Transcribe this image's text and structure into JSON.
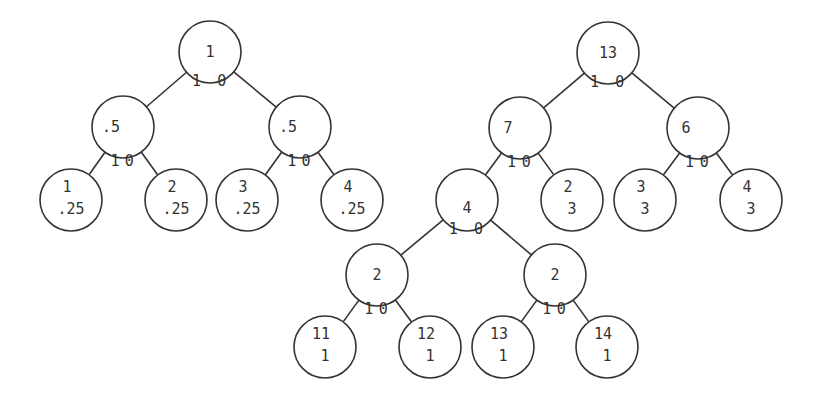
{
  "diagram": {
    "title": "",
    "colors": {
      "stroke": "#333333",
      "text": "#333333",
      "background": "#ffffff"
    },
    "node_radius": 31,
    "trees": [
      {
        "id": "left-tree",
        "nodes": [
          {
            "id": "L0",
            "x": 210,
            "y": 52,
            "lines": [
              "1"
            ]
          },
          {
            "id": "L1",
            "x": 123,
            "y": 127,
            "lines": [
              ".5"
            ],
            "align": "left"
          },
          {
            "id": "L2",
            "x": 300,
            "y": 127,
            "lines": [
              ".5"
            ],
            "align": "left"
          },
          {
            "id": "L3",
            "x": 71,
            "y": 200,
            "lines": [
              "1",
              ".25"
            ]
          },
          {
            "id": "L4",
            "x": 176,
            "y": 200,
            "lines": [
              "2",
              ".25"
            ]
          },
          {
            "id": "L5",
            "x": 247,
            "y": 200,
            "lines": [
              "3",
              ".25"
            ]
          },
          {
            "id": "L6",
            "x": 352,
            "y": 200,
            "lines": [
              "4",
              ".25"
            ]
          }
        ],
        "edges": [
          {
            "from": "L0",
            "to": "L1",
            "label": "1"
          },
          {
            "from": "L0",
            "to": "L2",
            "label": "0"
          },
          {
            "from": "L1",
            "to": "L3",
            "label": "1"
          },
          {
            "from": "L1",
            "to": "L4",
            "label": "0"
          },
          {
            "from": "L2",
            "to": "L5",
            "label": "1"
          },
          {
            "from": "L2",
            "to": "L6",
            "label": "0"
          }
        ]
      },
      {
        "id": "right-tree",
        "nodes": [
          {
            "id": "R0",
            "x": 608,
            "y": 53,
            "lines": [
              "13"
            ]
          },
          {
            "id": "R1",
            "x": 520,
            "y": 128,
            "lines": [
              "7"
            ],
            "align": "left"
          },
          {
            "id": "R2",
            "x": 698,
            "y": 128,
            "lines": [
              "6"
            ],
            "align": "left"
          },
          {
            "id": "R3",
            "x": 467,
            "y": 200,
            "lines": [
              "4"
            ],
            "valign": "low"
          },
          {
            "id": "R4",
            "x": 572,
            "y": 200,
            "lines": [
              "2",
              "3"
            ]
          },
          {
            "id": "R5",
            "x": 645,
            "y": 200,
            "lines": [
              "3",
              "3"
            ]
          },
          {
            "id": "R6",
            "x": 751,
            "y": 200,
            "lines": [
              "4",
              "3"
            ]
          },
          {
            "id": "R7",
            "x": 377,
            "y": 275,
            "lines": [
              "2"
            ]
          },
          {
            "id": "R8",
            "x": 555,
            "y": 275,
            "lines": [
              "2"
            ]
          },
          {
            "id": "R9",
            "x": 325,
            "y": 347,
            "lines": [
              "11",
              "1"
            ]
          },
          {
            "id": "R10",
            "x": 430,
            "y": 347,
            "lines": [
              "12",
              "1"
            ]
          },
          {
            "id": "R11",
            "x": 503,
            "y": 347,
            "lines": [
              "13",
              "1"
            ]
          },
          {
            "id": "R12",
            "x": 607,
            "y": 347,
            "lines": [
              "14",
              "1"
            ]
          }
        ],
        "edges": [
          {
            "from": "R0",
            "to": "R1",
            "label": "1"
          },
          {
            "from": "R0",
            "to": "R2",
            "label": "0"
          },
          {
            "from": "R1",
            "to": "R3",
            "label": "1"
          },
          {
            "from": "R1",
            "to": "R4",
            "label": "0"
          },
          {
            "from": "R2",
            "to": "R5",
            "label": "1"
          },
          {
            "from": "R2",
            "to": "R6",
            "label": "0"
          },
          {
            "from": "R3",
            "to": "R7",
            "label": "1"
          },
          {
            "from": "R3",
            "to": "R8",
            "label": "0"
          },
          {
            "from": "R7",
            "to": "R9",
            "label": "1"
          },
          {
            "from": "R7",
            "to": "R10",
            "label": "0"
          },
          {
            "from": "R8",
            "to": "R11",
            "label": "1"
          },
          {
            "from": "R8",
            "to": "R12",
            "label": "0"
          }
        ]
      }
    ]
  }
}
